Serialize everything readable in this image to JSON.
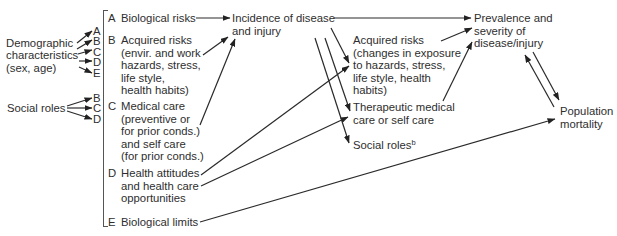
{
  "diagram": {
    "sources": {
      "demographic": "Demographic\ncharacteristics\n(sex, age)",
      "demographic_targets": [
        "A",
        "B",
        "C",
        "D",
        "E"
      ],
      "social_roles": "Social roles",
      "social_roles_targets": [
        "B",
        "C",
        "D"
      ]
    },
    "factors": [
      {
        "letter": "A",
        "text": "Biological risks"
      },
      {
        "letter": "B",
        "text": "Acquired risks\n(envir. and work\nhazards, stress,\nlife style,\nhealth habits)"
      },
      {
        "letter": "C",
        "text": "Medical care\n(preventive or\nfor prior conds.)\nand self care\n(for prior conds.)"
      },
      {
        "letter": "D",
        "text": "Health attitudes\nand health care\nopportunities"
      },
      {
        "letter": "E",
        "text": "Biological limits"
      }
    ],
    "nodes": {
      "incidence": "Incidence of disease\nand injury",
      "acquired_risks_changes": "Acquired risks\n(changes in exposure\nto hazards, stress,\nlife style, health\nhabits)",
      "therapeutic": "Therapeutic medical\ncare or self care",
      "social_roles_out": "Social roles",
      "social_roles_out_sup": "b",
      "prevalence": "Prevalence and\nseverity of\ndisease/injury",
      "mortality": "Population\nmortality"
    },
    "edges": [
      {
        "from": "A",
        "to": "incidence"
      },
      {
        "from": "B",
        "to": "incidence"
      },
      {
        "from": "C",
        "to": "incidence"
      },
      {
        "from": "D",
        "to": "acquired_risks_changes"
      },
      {
        "from": "D",
        "to": "therapeutic"
      },
      {
        "from": "E",
        "to": "mortality"
      },
      {
        "from": "incidence",
        "to": "prevalence"
      },
      {
        "from": "incidence",
        "to": "acquired_risks_changes"
      },
      {
        "from": "incidence",
        "to": "therapeutic"
      },
      {
        "from": "incidence",
        "to": "social_roles_out"
      },
      {
        "from": "acquired_risks_changes",
        "to": "prevalence"
      },
      {
        "from": "therapeutic",
        "to": "prevalence"
      },
      {
        "from": "prevalence",
        "to": "mortality"
      },
      {
        "from": "mortality",
        "to": "prevalence"
      }
    ],
    "colors": {
      "ink": "#2e2e2e",
      "background": "#ffffff"
    }
  }
}
